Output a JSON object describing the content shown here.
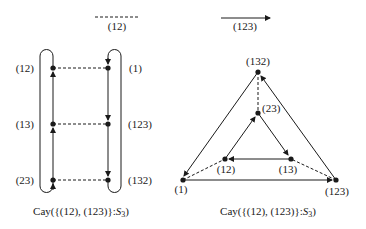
{
  "legend": {
    "dashed_label": "(12)",
    "arrow_label": "(123)"
  },
  "left_graph": {
    "caption_prefix": "Cay({(12), (123)}:",
    "caption_group": "S",
    "caption_sub": "3",
    "caption_suffix": ")",
    "vertices": [
      {
        "id": "12",
        "label": "(12)"
      },
      {
        "id": "13",
        "label": "(13)"
      },
      {
        "id": "23",
        "label": "(23)"
      },
      {
        "id": "1",
        "label": "(1)"
      },
      {
        "id": "123",
        "label": "(123)"
      },
      {
        "id": "132",
        "label": "(132)"
      }
    ]
  },
  "right_graph": {
    "caption_prefix": "Cay({(12), (123)}:",
    "caption_group": "S",
    "caption_sub": "3",
    "caption_suffix": ")",
    "vertices": [
      {
        "id": "132",
        "label": "(132)"
      },
      {
        "id": "23",
        "label": "(23)"
      },
      {
        "id": "12",
        "label": "(12)"
      },
      {
        "id": "13",
        "label": "(13)"
      },
      {
        "id": "1",
        "label": "(1)"
      },
      {
        "id": "123",
        "label": "(123)"
      }
    ]
  },
  "colors": {
    "ink": "#1a1a1a",
    "background": "#ffffff"
  }
}
